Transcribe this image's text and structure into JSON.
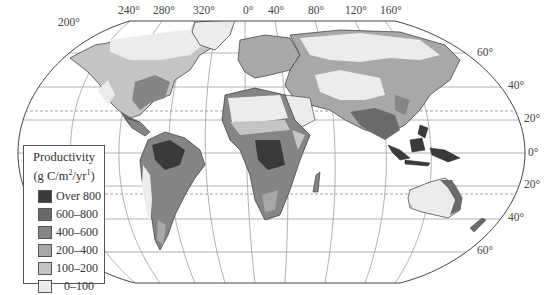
{
  "map": {
    "title": "Global Net Primary Productivity",
    "projection": "Robinson-like",
    "longitude_labels": [
      {
        "text": "200°",
        "x": 58,
        "y": 17
      },
      {
        "text": "240°",
        "x": 118,
        "y": 5
      },
      {
        "text": "280°",
        "x": 153,
        "y": 5
      },
      {
        "text": "320°",
        "x": 193,
        "y": 5
      },
      {
        "text": "0°",
        "x": 243,
        "y": 5
      },
      {
        "text": "40°",
        "x": 268,
        "y": 5
      },
      {
        "text": "80°",
        "x": 308,
        "y": 5
      },
      {
        "text": "120°",
        "x": 345,
        "y": 5
      },
      {
        "text": "160°",
        "x": 380,
        "y": 5
      }
    ],
    "latitude_labels": [
      {
        "text": "60°",
        "x": 477,
        "y": 47
      },
      {
        "text": "40°",
        "x": 508,
        "y": 80
      },
      {
        "text": "20°",
        "x": 524,
        "y": 113
      },
      {
        "text": "0°",
        "x": 528,
        "y": 147
      },
      {
        "text": "20°",
        "x": 524,
        "y": 179
      },
      {
        "text": "40°",
        "x": 508,
        "y": 212
      },
      {
        "text": "60°",
        "x": 477,
        "y": 245
      }
    ]
  },
  "legend": {
    "title": "Productivity",
    "unit_prefix": "(g C/m",
    "unit_sup1": "2",
    "unit_mid": "/yr",
    "unit_sup2": "1",
    "unit_suffix": ")",
    "items": [
      {
        "label": "Over 800",
        "color": "#3a3a3a"
      },
      {
        "label": "600–800",
        "color": "#6a6a6a"
      },
      {
        "label": "400–600",
        "color": "#858585"
      },
      {
        "label": "200–400",
        "color": "#a8a8a8"
      },
      {
        "label": "100–200",
        "color": "#c4c4c4"
      },
      {
        "label": "0–100",
        "color": "#ececec"
      }
    ]
  },
  "colors": {
    "over800": "#3a3a3a",
    "c600_800": "#6a6a6a",
    "c400_600": "#858585",
    "c200_400": "#a8a8a8",
    "c100_200": "#c4c4c4",
    "c0_100": "#ececec",
    "grid": "#9a9a9a",
    "outline": "#444444"
  }
}
